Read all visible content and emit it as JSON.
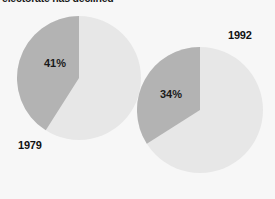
{
  "chart_data": {
    "type": "pie",
    "title": "electorate has declined",
    "xlabel": "",
    "ylabel": "",
    "legend_position": "none",
    "grid": false,
    "colors": {
      "slice_highlight": "#b3b3b3",
      "slice_remainder": "#e7e7e7",
      "background": "#f7f7f7",
      "text": "#1a1a1a"
    },
    "charts": [
      {
        "name": "1979",
        "year_label": "1979",
        "categories": [
          "share",
          "remainder"
        ],
        "values": [
          41,
          59
        ],
        "data_labels": [
          "41%",
          ""
        ],
        "highlight_label": "41%"
      },
      {
        "name": "1992",
        "year_label": "1992",
        "categories": [
          "share",
          "remainder"
        ],
        "values": [
          34,
          66
        ],
        "data_labels": [
          "34%",
          ""
        ],
        "highlight_label": "34%"
      }
    ]
  }
}
